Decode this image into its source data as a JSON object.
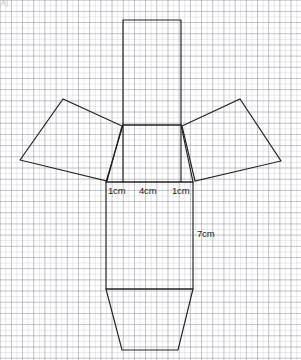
{
  "page": {
    "corner_mark": "A)"
  },
  "canvas": {
    "width": 301,
    "height": 360,
    "background": "#ffffff"
  },
  "grid": {
    "minor_spacing_px": 5.6,
    "major_spacing_px": 11.2,
    "minor_color": "#d9d9de",
    "major_color": "#b9b9c2"
  },
  "diagram": {
    "name": "prism-net",
    "stroke_color": "#231f20",
    "stroke_width": 1.15,
    "fill": "none",
    "shapes": [
      {
        "name": "top-flap-rectangle",
        "type": "polygon",
        "points": "123,20 181,20 181,125 123,125"
      },
      {
        "name": "neck-trapezoid",
        "type": "polygon",
        "points": "123,125 181,125 193,182 106,182"
      },
      {
        "name": "left-wing-panel",
        "type": "polygon",
        "points": "20,160 63,99 122,126 107,181"
      },
      {
        "name": "right-wing-panel",
        "type": "polygon",
        "points": "182,126 240,99 281,161 195,181"
      },
      {
        "name": "main-body-rectangle",
        "type": "polygon",
        "points": "106,182 193,182 193,289 106,289"
      },
      {
        "name": "bottom-flap-trapezoid",
        "type": "polygon",
        "points": "106,289 193,289 178,350 122,350"
      },
      {
        "name": "inner-fold-line-left",
        "type": "polyline",
        "points": "123,125 123,182"
      },
      {
        "name": "inner-fold-line-right",
        "type": "polyline",
        "points": "181,125 181,182"
      }
    ]
  },
  "labels": {
    "width_left": {
      "text": "1cm",
      "x": 108,
      "y": 185
    },
    "width_middle": {
      "text": "4cm",
      "x": 139,
      "y": 185
    },
    "width_right": {
      "text": "1cm",
      "x": 172,
      "y": 185
    },
    "height_right": {
      "text": "7cm",
      "x": 197,
      "y": 228
    }
  }
}
